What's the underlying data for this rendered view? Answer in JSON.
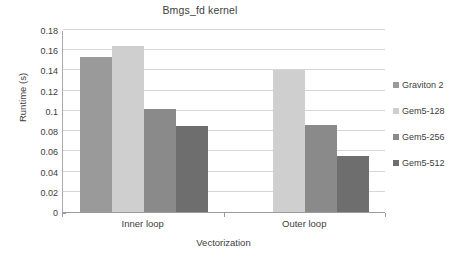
{
  "chart_data": {
    "type": "bar",
    "title": "Bmgs_fd kernel",
    "xlabel": "Vectorization",
    "ylabel": "Runtime (s)",
    "categories": [
      "Inner loop",
      "Outer loop"
    ],
    "series": [
      {
        "name": "Graviton 2",
        "values": [
          0.153,
          0
        ],
        "color": "#9a9a9a"
      },
      {
        "name": "Gem5-128",
        "values": [
          0.164,
          0.14
        ],
        "color": "#cfcfcf"
      },
      {
        "name": "Gem5-256",
        "values": [
          0.102,
          0.0865
        ],
        "color": "#8a8a8a"
      },
      {
        "name": "Gem5-512",
        "values": [
          0.085,
          0.055
        ],
        "color": "#6e6e6e"
      }
    ],
    "ylim": [
      0,
      0.18
    ],
    "ytick_step": 0.02,
    "ytick_labels": [
      "0",
      "0.02",
      "0.04",
      "0.06",
      "0.08",
      "0.1",
      "0.12",
      "0.14",
      "0.16",
      "0.18"
    ],
    "ytick_values": [
      0,
      0.02,
      0.04,
      0.06,
      0.08,
      0.1,
      0.12,
      0.14,
      0.16,
      0.18
    ],
    "grid": true,
    "legend_position": "right",
    "plot_background": "#ffffff",
    "gridline_color": "#d6d6d6",
    "axis_color": "#9a9a9a",
    "text_color": "#3d3d3d"
  }
}
